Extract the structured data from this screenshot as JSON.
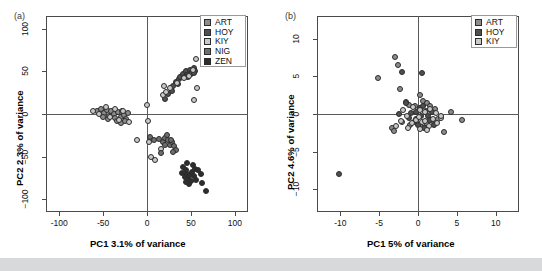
{
  "figure": {
    "background": "#ffffff",
    "page_background": "#d8d9da"
  },
  "panels": [
    {
      "letter": "(a)",
      "title": "RADseq",
      "xlabel": "PC1 3.1% of variance",
      "ylabel": "PC2 2.3% of variance",
      "xticks": [
        "-100",
        "-50",
        "0",
        "50",
        "100"
      ],
      "yticks": [
        "100",
        "50",
        "0",
        "-50",
        "-100"
      ],
      "legend": [
        {
          "label": "ART",
          "color": "#8c8c8c"
        },
        {
          "label": "HOY",
          "color": "#4f4f4f"
        },
        {
          "label": "KIY",
          "color": "#c9c9c9"
        },
        {
          "label": "NIG",
          "color": "#6e6e6e"
        },
        {
          "label": "ZEN",
          "color": "#2e2e2e"
        }
      ]
    },
    {
      "letter": "(b)",
      "title": "Microsatellites",
      "xlabel": "PC1 5% of variance",
      "ylabel": "PC2 4.6% of variance",
      "xticks": [
        "-10",
        "-5",
        "0",
        "5",
        "10"
      ],
      "yticks": [
        "10",
        "5",
        "0",
        "-5",
        "-10"
      ],
      "legend": [
        {
          "label": "ART",
          "color": "#8c8c8c"
        },
        {
          "label": "HOY",
          "color": "#4f4f4f"
        },
        {
          "label": "KIY",
          "color": "#c9c9c9"
        }
      ]
    }
  ],
  "chart_data": [
    {
      "type": "scatter",
      "panel": "(a)",
      "title": "RADseq",
      "xlabel": "PC1 3.1% of variance",
      "ylabel": "PC2 2.3% of variance",
      "xlim": [
        -115,
        115
      ],
      "ylim": [
        -115,
        115
      ],
      "xticks": [
        -100,
        -50,
        0,
        50,
        100
      ],
      "yticks": [
        -100,
        -50,
        0,
        50,
        100
      ],
      "grid": false,
      "legend_position": "top-right",
      "series": [
        {
          "name": "ART",
          "color": "#8c8c8c",
          "points": [
            [
              -57,
              3
            ],
            [
              -52,
              6
            ],
            [
              -49,
              1
            ],
            [
              -46,
              5
            ],
            [
              -43,
              -2
            ],
            [
              -41,
              3
            ],
            [
              -38,
              0
            ],
            [
              -36,
              -5
            ],
            [
              -33,
              2
            ],
            [
              -30,
              -3
            ],
            [
              -28,
              4
            ],
            [
              -26,
              -1
            ],
            [
              -24,
              -6
            ],
            [
              -22,
              1
            ],
            [
              -34,
              -8
            ],
            [
              -44,
              -6
            ],
            [
              -50,
              -3
            ],
            [
              -30,
              -10
            ],
            [
              -25,
              -8
            ]
          ]
        },
        {
          "name": "HOY",
          "color": "#4f4f4f",
          "points": [
            [
              20,
              18
            ],
            [
              24,
              24
            ],
            [
              27,
              30
            ],
            [
              30,
              33
            ],
            [
              33,
              38
            ],
            [
              36,
              41
            ],
            [
              38,
              44
            ],
            [
              41,
              47
            ],
            [
              44,
              50
            ],
            [
              46,
              46
            ],
            [
              49,
              52
            ],
            [
              51,
              49
            ],
            [
              53,
              54
            ],
            [
              55,
              51
            ],
            [
              29,
              27
            ],
            [
              35,
              35
            ],
            [
              43,
              43
            ],
            [
              47,
              44
            ],
            [
              50,
              47
            ],
            [
              54,
              48
            ]
          ]
        },
        {
          "name": "KIY",
          "color": "#c9c9c9",
          "points": [
            [
              -62,
              4
            ],
            [
              -55,
              0
            ],
            [
              -47,
              8
            ],
            [
              -42,
              -4
            ],
            [
              -37,
              6
            ],
            [
              -32,
              -7
            ],
            [
              -27,
              3
            ],
            [
              -21,
              -9
            ],
            [
              18,
              22
            ],
            [
              22,
              26
            ],
            [
              26,
              31
            ],
            [
              34,
              36
            ],
            [
              42,
              42
            ],
            [
              48,
              45
            ],
            [
              52,
              52
            ],
            [
              56,
              65
            ],
            [
              57,
              30
            ],
            [
              54,
              17
            ],
            [
              19,
              33
            ],
            [
              -11,
              -30
            ],
            [
              2,
              -33
            ],
            [
              5,
              -50
            ],
            [
              9,
              -54
            ],
            [
              16,
              -41
            ],
            [
              0,
              11
            ],
            [
              1,
              -8
            ]
          ]
        },
        {
          "name": "NIG",
          "color": "#6e6e6e",
          "points": [
            [
              3,
              -27
            ],
            [
              8,
              -31
            ],
            [
              14,
              -29
            ],
            [
              18,
              -33
            ],
            [
              21,
              -28
            ],
            [
              24,
              -31
            ],
            [
              26,
              -36
            ],
            [
              29,
              -33
            ],
            [
              31,
              -38
            ],
            [
              33,
              -42
            ],
            [
              23,
              -25
            ],
            [
              27,
              -30
            ],
            [
              20,
              -36
            ],
            [
              30,
              -45
            ],
            [
              16,
              -46
            ]
          ]
        },
        {
          "name": "ZEN",
          "color": "#2e2e2e",
          "points": [
            [
              41,
              -62
            ],
            [
              44,
              -66
            ],
            [
              46,
              -70
            ],
            [
              43,
              -74
            ],
            [
              47,
              -76
            ],
            [
              49,
              -72
            ],
            [
              51,
              -68
            ],
            [
              53,
              -73
            ],
            [
              50,
              -79
            ],
            [
              48,
              -82
            ],
            [
              55,
              -64
            ],
            [
              58,
              -66
            ],
            [
              61,
              -70
            ],
            [
              63,
              -81
            ],
            [
              67,
              -90
            ],
            [
              45,
              -58
            ],
            [
              52,
              -60
            ],
            [
              40,
              -69
            ],
            [
              44,
              -80
            ],
            [
              56,
              -78
            ]
          ]
        }
      ]
    },
    {
      "type": "scatter",
      "panel": "(b)",
      "title": "Microsatellites",
      "xlabel": "PC1 5% of variance",
      "ylabel": "PC2 4.6% of variance",
      "xlim": [
        -13,
        13
      ],
      "ylim": [
        -13,
        13
      ],
      "xticks": [
        -10,
        -5,
        0,
        5,
        10
      ],
      "yticks": [
        -10,
        -5,
        0,
        5,
        10
      ],
      "grid": false,
      "legend_position": "top-right",
      "series": [
        {
          "name": "ART",
          "color": "#8c8c8c",
          "points": [
            [
              -3.0,
              7.5
            ],
            [
              -5.1,
              4.8
            ],
            [
              -2.6,
              6.5
            ],
            [
              -2.3,
              3.3
            ],
            [
              -1.6,
              1.6
            ],
            [
              -1.2,
              1.2
            ],
            [
              -0.4,
              1.0
            ],
            [
              0.3,
              2.5
            ],
            [
              0.6,
              1.7
            ],
            [
              1.1,
              1.5
            ],
            [
              1.6,
              1.1
            ],
            [
              2.2,
              0.6
            ],
            [
              -3.3,
              -1.9
            ],
            [
              -3.1,
              -2.2
            ],
            [
              -2.0,
              -1.1
            ],
            [
              -1.0,
              -1.4
            ],
            [
              0.4,
              -1.7
            ],
            [
              1.2,
              -1.3
            ],
            [
              2.0,
              -1.0
            ],
            [
              2.6,
              -0.7
            ],
            [
              3.3,
              -2.4
            ],
            [
              5.7,
              -0.8
            ],
            [
              4.3,
              0.2
            ]
          ]
        },
        {
          "name": "HOY",
          "color": "#4f4f4f",
          "points": [
            [
              -10.2,
              -8.0
            ],
            [
              0.5,
              5.4
            ],
            [
              -2.1,
              5.6
            ],
            [
              -1.6,
              1.4
            ],
            [
              -0.9,
              0.1
            ],
            [
              -0.2,
              0.3
            ],
            [
              0.2,
              0.8
            ],
            [
              0.7,
              1.1
            ],
            [
              1.0,
              0.4
            ],
            [
              1.3,
              -0.2
            ],
            [
              -2.4,
              0.0
            ],
            [
              -1.1,
              -0.5
            ],
            [
              -0.5,
              -1.0
            ],
            [
              0.0,
              -1.5
            ],
            [
              0.8,
              -1.8
            ],
            [
              1.5,
              -0.8
            ],
            [
              2.1,
              -1.4
            ],
            [
              -0.3,
              -0.6
            ],
            [
              0.4,
              -0.3
            ],
            [
              1.8,
              0.2
            ]
          ]
        },
        {
          "name": "KIY",
          "color": "#c9c9c9",
          "points": [
            [
              -1.9,
              0.5
            ],
            [
              -1.4,
              -0.3
            ],
            [
              -0.8,
              -1.2
            ],
            [
              -0.2,
              -0.8
            ],
            [
              0.1,
              -0.4
            ],
            [
              0.5,
              -1.1
            ],
            [
              0.9,
              -0.9
            ],
            [
              1.4,
              -1.6
            ],
            [
              1.9,
              -0.6
            ],
            [
              2.4,
              -1.2
            ],
            [
              2.9,
              -0.5
            ],
            [
              -2.8,
              -1.6
            ],
            [
              -2.2,
              -0.9
            ],
            [
              0.3,
              0.5
            ],
            [
              0.9,
              0.2
            ],
            [
              1.6,
              0.7
            ],
            [
              2.3,
              0.1
            ],
            [
              -0.6,
              0.9
            ],
            [
              0.2,
              -2.0
            ],
            [
              1.1,
              -2.1
            ],
            [
              3.0,
              -0.3
            ],
            [
              -1.3,
              -1.8
            ]
          ]
        }
      ]
    }
  ]
}
